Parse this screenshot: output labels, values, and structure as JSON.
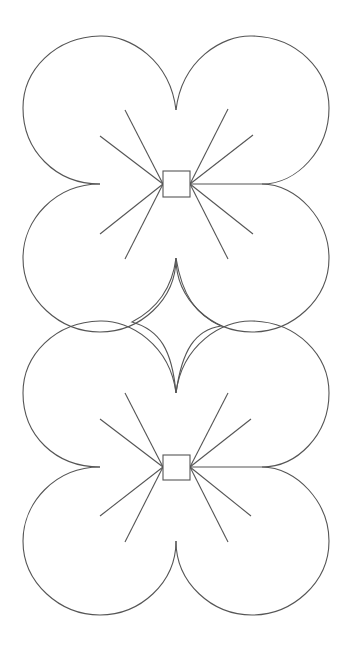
{
  "canvas": {
    "width": 354,
    "height": 653,
    "background": "#ffffff"
  },
  "style": {
    "stroke": "#555555",
    "stroke_width": 1.1
  },
  "flowers": [
    {
      "name": "top-flower",
      "center": [
        176,
        184
      ],
      "square": {
        "x": 163,
        "y": 171,
        "w": 27,
        "h": 26
      },
      "petals": [
        {
          "name": "petal-top-left",
          "path": "M176,110 C170,60 130,35 100,36 C55,37 23,70 23,108 C23,150 55,184 100,184"
        },
        {
          "name": "petal-top-right",
          "path": "M176,110 C182,60 222,35 252,36 C297,37 329,70 329,108 C329,150 297,184 262,184"
        },
        {
          "name": "petal-bottom-left",
          "path": "M100,184 C55,184 23,220 23,258 C23,300 60,332 100,332 C140,332 176,300 176,258"
        },
        {
          "name": "petal-bottom-right",
          "path": "M262,184 C297,184 329,220 329,258 C329,300 292,332 252,332 C212,332 176,300 176,258"
        }
      ],
      "rays": [
        {
          "from": [
            163,
            184
          ],
          "to": [
            125,
            110
          ]
        },
        {
          "from": [
            163,
            184
          ],
          "to": [
            100,
            136
          ]
        },
        {
          "from": [
            163,
            184
          ],
          "to": [
            100,
            234
          ]
        },
        {
          "from": [
            163,
            184
          ],
          "to": [
            125,
            259
          ]
        },
        {
          "from": [
            190,
            184
          ],
          "to": [
            228,
            109
          ]
        },
        {
          "from": [
            190,
            184
          ],
          "to": [
            253,
            135
          ]
        },
        {
          "from": [
            190,
            184
          ],
          "to": [
            262,
            184
          ]
        },
        {
          "from": [
            190,
            184
          ],
          "to": [
            253,
            234
          ]
        },
        {
          "from": [
            190,
            184
          ],
          "to": [
            228,
            259
          ]
        }
      ]
    },
    {
      "name": "bottom-flower",
      "center": [
        176,
        467
      ],
      "square": {
        "x": 163,
        "y": 455,
        "w": 27,
        "h": 25
      },
      "petals": [
        {
          "name": "petal-top-left",
          "path": "M176,393 C170,345 130,320 100,321 C55,322 23,355 23,393 C23,435 55,467 100,467"
        },
        {
          "name": "petal-top-right",
          "path": "M176,393 C182,345 222,320 252,321 C297,322 329,355 329,393 C329,435 297,467 262,467"
        },
        {
          "name": "petal-bottom-left",
          "path": "M100,467 C55,467 23,503 23,541 C23,583 60,615 100,615 C140,615 176,583 176,541"
        },
        {
          "name": "petal-bottom-right",
          "path": "M262,467 C297,467 329,503 329,541 C329,583 292,615 252,615 C212,615 176,583 176,541"
        }
      ],
      "rays": [
        {
          "from": [
            163,
            467
          ],
          "to": [
            125,
            393
          ]
        },
        {
          "from": [
            163,
            467
          ],
          "to": [
            100,
            419
          ]
        },
        {
          "from": [
            163,
            467
          ],
          "to": [
            100,
            516
          ]
        },
        {
          "from": [
            163,
            467
          ],
          "to": [
            125,
            542
          ]
        },
        {
          "from": [
            190,
            467
          ],
          "to": [
            228,
            393
          ]
        },
        {
          "from": [
            190,
            467
          ],
          "to": [
            251,
            419
          ]
        },
        {
          "from": [
            190,
            467
          ],
          "to": [
            262,
            467
          ]
        },
        {
          "from": [
            190,
            467
          ],
          "to": [
            251,
            516
          ]
        },
        {
          "from": [
            190,
            467
          ],
          "to": [
            228,
            542
          ]
        }
      ]
    }
  ],
  "connector": {
    "name": "middle-four-point-star",
    "path": "M176,258 C172,290 155,310 132,322 C160,330 172,350 176,393 C182,350 195,330 221,326 C196,315 182,295 176,258"
  }
}
